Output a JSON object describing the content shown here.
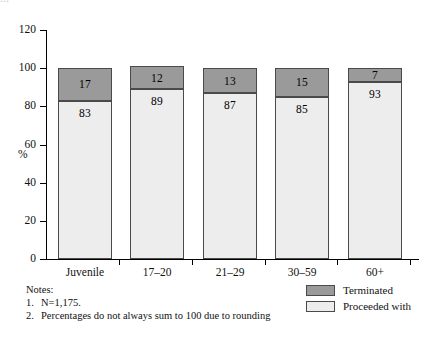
{
  "figure": {
    "cropped_title_fragment": "…",
    "background_color": "#ffffff"
  },
  "axes": {
    "ylabel": "%",
    "yticks": [
      0,
      20,
      40,
      60,
      80,
      100,
      120
    ],
    "ytick_labels": [
      "0",
      "20",
      "40",
      "60",
      "80",
      "100",
      "120"
    ],
    "ymin": 0,
    "ymax": 120
  },
  "legend": {
    "position": "bottom-right",
    "items": [
      {
        "label": "Terminated",
        "color": "#9a9a9a"
      },
      {
        "label": "Proceeded with",
        "color": "#ededed"
      }
    ]
  },
  "notes": {
    "heading": "Notes:",
    "items": [
      {
        "num": "1.",
        "text": "N=1,175."
      },
      {
        "num": "2.",
        "text": "Percentages do not always sum to 100 due to rounding"
      }
    ]
  },
  "chart_data": {
    "type": "bar",
    "stacked": true,
    "title": "",
    "xlabel": "",
    "ylabel": "%",
    "ylim": [
      0,
      120
    ],
    "yticks": [
      0,
      20,
      40,
      60,
      80,
      100,
      120
    ],
    "grid": false,
    "legend_position": "bottom-right",
    "categories": [
      "Juvenile",
      "17–20",
      "21–29",
      "30–59",
      "60+"
    ],
    "series": [
      {
        "name": "Proceeded with",
        "color": "#ededed",
        "values": [
          83,
          89,
          87,
          85,
          93
        ]
      },
      {
        "name": "Terminated",
        "color": "#9a9a9a",
        "values": [
          17,
          12,
          13,
          15,
          7
        ]
      }
    ],
    "annotations": [
      "N=1,175.",
      "Percentages do not always sum to 100 due to rounding"
    ]
  }
}
